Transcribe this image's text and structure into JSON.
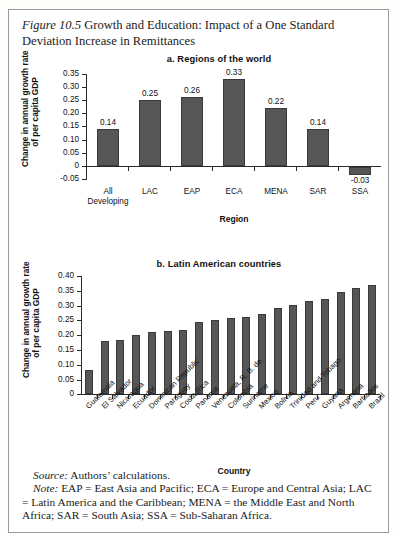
{
  "caption": {
    "figure_label": "Figure 10.5",
    "text": " Growth and Education: Impact of a One Standard Deviation Increase in Remittances"
  },
  "notes": {
    "source_label": "Source:",
    "source_text": " Authors’ calculations.",
    "note_label": "Note:",
    "note_text": " EAP = East Asia and Pacific; ECA = Europe and Central Asia; LAC = Latin America and the Caribbean; MENA = the Middle East and North Africa; SAR = South Asia; SSA = Sub-Saharan Africa."
  },
  "chart_data": [
    {
      "id": "panel-a",
      "type": "bar",
      "title": "a. Regions of the world",
      "xlabel": "Region",
      "ylabel": "Change in annual growth rate of per capita GDP",
      "ylabel_line1": "Change in annual growth rate",
      "ylabel_line2": "of per capita GDP",
      "ylim": [
        -0.05,
        0.35
      ],
      "ytick_labels": [
        "0.35",
        "0.30",
        "0.25",
        "0.20",
        "0.15",
        "0.10",
        "0.05",
        "0",
        "-0.05"
      ],
      "ytick_values": [
        0.35,
        0.3,
        0.25,
        0.2,
        0.15,
        0.1,
        0.05,
        0,
        -0.05
      ],
      "grid": false,
      "legend": "none",
      "categories": [
        "All Developing",
        "LAC",
        "EAP",
        "ECA",
        "MENA",
        "SAR",
        "SSA"
      ],
      "category_lines": [
        [
          "All",
          "Developing"
        ],
        [
          "LAC"
        ],
        [
          "EAP"
        ],
        [
          "ECA"
        ],
        [
          "MENA"
        ],
        [
          "SAR"
        ],
        [
          "SSA"
        ]
      ],
      "values": [
        0.14,
        0.25,
        0.26,
        0.33,
        0.22,
        0.14,
        -0.03
      ],
      "value_labels": [
        "0.14",
        "0.25",
        "0.26",
        "0.33",
        "0.22",
        "0.14",
        "-0.03"
      ]
    },
    {
      "id": "panel-b",
      "type": "bar",
      "title": "b. Latin American countries",
      "xlabel": "Country",
      "ylabel": "Change in annual growth rate of per capita GDP",
      "ylabel_line1": "Change in annual growth rate",
      "ylabel_line2": "of per capita GDP",
      "ylim": [
        0,
        0.4
      ],
      "ytick_labels": [
        "0.40",
        "0.35",
        "0.30",
        "0.25",
        "0.20",
        "0.15",
        "0.10",
        "0.05",
        "0"
      ],
      "ytick_values": [
        0.4,
        0.35,
        0.3,
        0.25,
        0.2,
        0.15,
        0.1,
        0.05,
        0
      ],
      "grid": false,
      "legend": "none",
      "categories": [
        "Guatemala",
        "El Salvador",
        "Nicaragua",
        "Ecuador",
        "Dominican Republic",
        "Paraguay",
        "Costa Rica",
        "Panama",
        "Venezuela, R. B. de",
        "Colombia",
        "Suriname",
        "Mexico",
        "Bolivia",
        "Trinidad and Tobago",
        "Peru",
        "Guyana",
        "Argentina",
        "Barbados",
        "Brazil"
      ],
      "values": [
        0.081,
        0.181,
        0.183,
        0.201,
        0.211,
        0.212,
        0.216,
        0.245,
        0.251,
        0.256,
        0.262,
        0.271,
        0.293,
        0.302,
        0.314,
        0.321,
        0.347,
        0.36,
        0.37
      ]
    }
  ],
  "colors": {
    "bar_fill": "#565656",
    "bar_stroke": "#3a3a3a",
    "axis": "#2a2a2a",
    "text": "#1b1b1b",
    "frame": "#9a9a96",
    "page_background": "#ffffff"
  }
}
